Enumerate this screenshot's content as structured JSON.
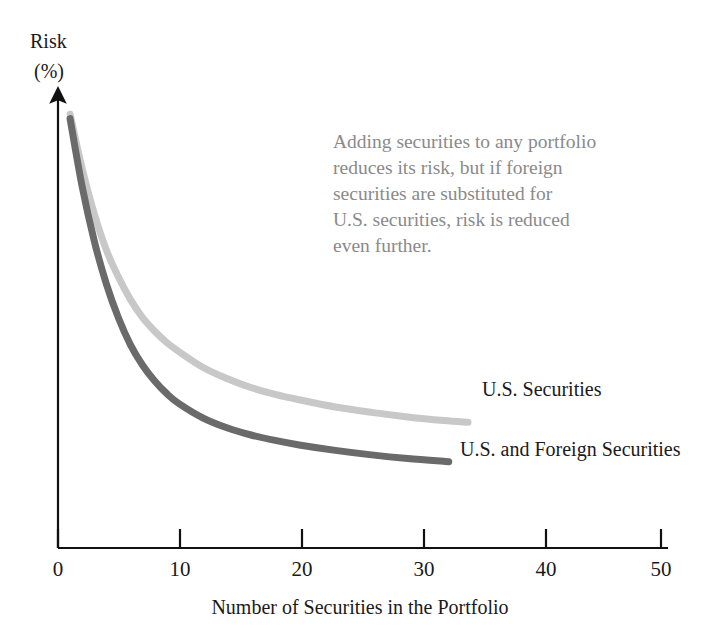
{
  "chart_data": {
    "type": "line",
    "title": "",
    "xlabel": "Number of Securities in the Portfolio",
    "ylabel": "Risk\n(%)",
    "ylabel_line1": "Risk",
    "ylabel_line2": "(%)",
    "xlim": [
      0,
      50
    ],
    "ylim": [
      0,
      100
    ],
    "grid": false,
    "x_ticks": [
      0,
      10,
      20,
      30,
      40,
      50
    ],
    "x_tick_labels": [
      "0",
      "10",
      "20",
      "30",
      "40",
      "50"
    ],
    "y_ticks": [],
    "y_tick_labels": [],
    "y_axis_style": "arrow",
    "legend_position": "inline-end-of-curve",
    "annotation": {
      "lines": [
        "Adding securities to any portfolio",
        "reduces its risk, but if foreign",
        "securities are substituted for",
        "U.S. securities, risk is reduced",
        "even further."
      ],
      "color": "#8a8a8a"
    },
    "series": [
      {
        "name": "U.S. Securities",
        "color": "#c8c8c8",
        "label": "U.S. Securities",
        "x": [
          1,
          2,
          3,
          4,
          5,
          6,
          7,
          8,
          9,
          10,
          12,
          14,
          16,
          18,
          20,
          23,
          26,
          29,
          32,
          34
        ],
        "y": [
          96,
          84,
          74,
          66,
          60,
          55,
          51,
          48,
          45.5,
          43.5,
          40,
          37.5,
          35.5,
          34,
          32.8,
          31.2,
          30,
          29,
          28.2,
          27.8
        ]
      },
      {
        "name": "U.S. and Foreign Securities",
        "color": "#6a6a6a",
        "label": "U.S. and Foreign Securities",
        "x": [
          1,
          2,
          3,
          4,
          5,
          6,
          7,
          8,
          9,
          10,
          12,
          14,
          16,
          18,
          20,
          23,
          26,
          29,
          32.4
        ],
        "y": [
          95,
          80,
          68,
          58.5,
          51,
          45,
          40.5,
          37,
          34.2,
          32,
          28.8,
          26.6,
          25,
          23.8,
          22.8,
          21.6,
          20.6,
          19.8,
          19.1
        ]
      }
    ]
  },
  "labels": {
    "series_1_label": "U.S. Securities",
    "series_2_label": "U.S. and Foreign Securities",
    "x_axis_title": "Number of Securities in the Portfolio",
    "y_axis_title_line1": "Risk",
    "y_axis_title_line2": "(%)"
  },
  "annotation_lines": {
    "l1": "Adding securities to any portfolio",
    "l2": "reduces its risk, but if foreign",
    "l3": "securities are substituted for",
    "l4": "U.S. securities, risk is reduced",
    "l5": "even further."
  },
  "x_tick_labels": {
    "t0": "0",
    "t1": "10",
    "t2": "20",
    "t3": "30",
    "t4": "40",
    "t5": "50"
  },
  "colors": {
    "us_securities": "#c8c8c8",
    "us_and_foreign": "#6a6a6a",
    "axis": "#111111",
    "annotation": "#8a8a8a",
    "text": "#1a1a1a",
    "background": "#ffffff"
  }
}
